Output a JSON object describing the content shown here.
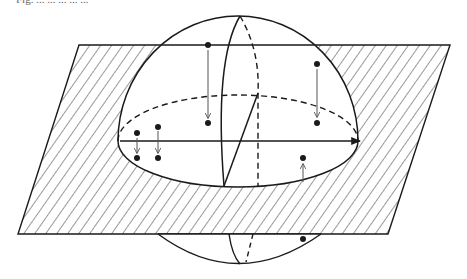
{
  "caption": {
    "text": "Fig. ... ... ... ... ..."
  },
  "diagram": {
    "type": "sphere-intersecting-plane",
    "plane": {
      "shape": "parallelogram",
      "fill": "diagonal-hatch",
      "corners": [
        [
          79,
          45
        ],
        [
          450,
          45
        ],
        [
          388,
          234
        ],
        [
          18,
          234
        ]
      ]
    },
    "sphere": {
      "center": [
        238,
        140
      ],
      "radius_x": 120,
      "top": 16,
      "bottom": 264
    },
    "equator": {
      "cx": 238,
      "cy": 141,
      "rx": 120,
      "ry": 46,
      "front": "solid",
      "back": "dashed"
    },
    "axis_arrow": {
      "from": [
        120,
        141
      ],
      "to": [
        362,
        141
      ]
    },
    "points": [
      {
        "name": "point-upper-left",
        "pos": [
          208,
          45
        ],
        "projects_to": [
          208,
          123
        ],
        "direction": "down"
      },
      {
        "name": "point-upper-right",
        "pos": [
          317,
          64
        ],
        "projects_to": [
          317,
          123
        ],
        "direction": "down"
      },
      {
        "name": "point-left-1",
        "pos": [
          137,
          133
        ],
        "projects_to": [
          137,
          158
        ],
        "direction": "down"
      },
      {
        "name": "point-left-2",
        "pos": [
          158,
          127
        ],
        "projects_to": [
          158,
          158
        ],
        "direction": "down"
      },
      {
        "name": "point-right-lower",
        "pos": [
          303,
          158
        ],
        "arrow_from": [
          303,
          182
        ],
        "direction": "up"
      },
      {
        "name": "point-below-plane",
        "pos": [
          303,
          239
        ]
      }
    ],
    "colors": {
      "stroke": "#1a1a1a",
      "hatch": "#333333",
      "arrow": "#555555",
      "background": "#ffffff"
    }
  }
}
